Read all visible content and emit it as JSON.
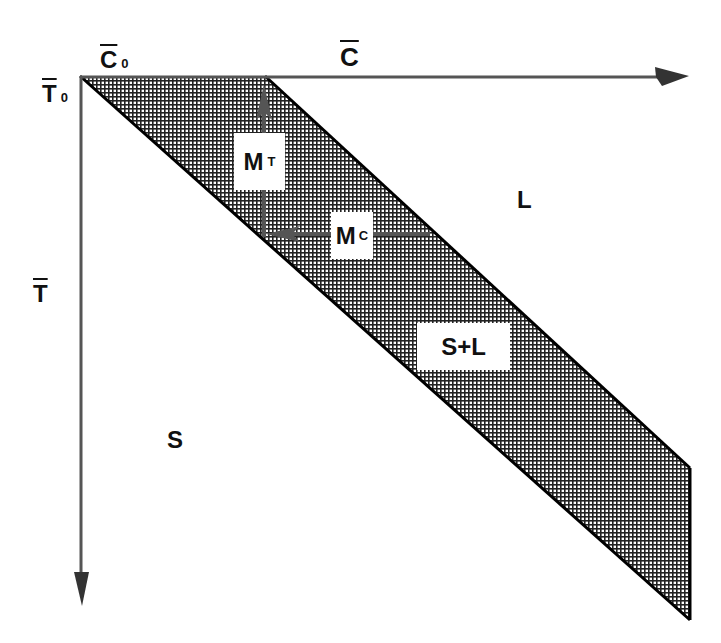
{
  "diagram": {
    "type": "phase-diagram",
    "axes": {
      "x": {
        "symbol": "C",
        "overline": true,
        "origin_label": "C",
        "origin_sub": "0"
      },
      "y": {
        "symbol": "T",
        "overline": true,
        "origin_label": "T",
        "origin_sub": "0"
      }
    },
    "regions": {
      "liquid": "L",
      "solid": "S",
      "mushy": "S+L"
    },
    "arrows": {
      "mt": {
        "label": "M",
        "sub": "T"
      },
      "mc": {
        "label": "M",
        "sub": "C"
      }
    },
    "colors": {
      "axis": "#555555",
      "edge": "#000000",
      "hatch": "#222222",
      "background": "#ffffff"
    }
  }
}
